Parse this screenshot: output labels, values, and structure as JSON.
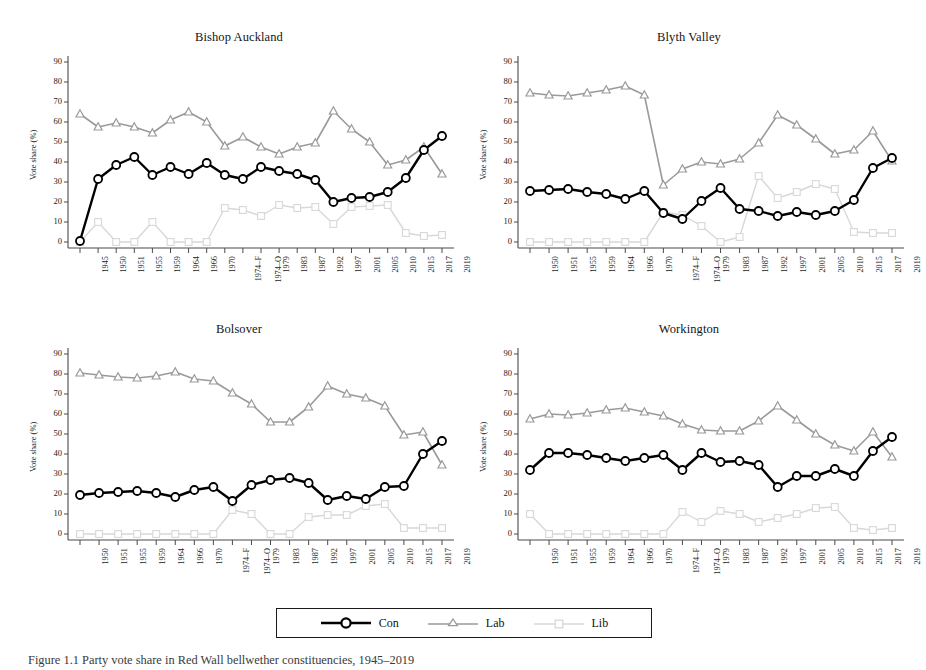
{
  "figure": {
    "caption": "Figure 1.1  Party vote share in Red Wall bellwether constituencies, 1945–2019",
    "ylabel": "Vote share (%)",
    "yticks": [
      0,
      10,
      20,
      30,
      40,
      50,
      60,
      70,
      80,
      90
    ],
    "ylim": [
      -3,
      95
    ]
  },
  "legend": {
    "position": "bottom-center",
    "items": [
      {
        "label": "Con",
        "color": "#000000",
        "marker": "circle"
      },
      {
        "label": "Lab",
        "color": "#9a9a9a",
        "marker": "triangle"
      },
      {
        "label": "Lib",
        "color": "#d5d5d5",
        "marker": "square"
      }
    ]
  },
  "colors": {
    "con": "#000000",
    "lab": "#9a9a9a",
    "lib": "#d8d8d8",
    "axis": "#4a4a4a"
  },
  "chart_data": [
    {
      "type": "line",
      "title": "Bishop Auckland",
      "xlabel": "",
      "ylabel": "Vote share (%)",
      "ylim": [
        -3,
        95
      ],
      "grid": false,
      "legend": "bottom",
      "categories": [
        "1945",
        "1950",
        "1951",
        "1955",
        "1959",
        "1964",
        "1966",
        "1970",
        "1974–F",
        "1974–O",
        "1979",
        "1983",
        "1987",
        "1992",
        "1997",
        "2001",
        "2005",
        "2010",
        "2015",
        "2017",
        "2019"
      ],
      "series": [
        {
          "name": "Con",
          "values": [
            0.5,
            31.5,
            38.5,
            42.5,
            33.5,
            37.5,
            34.0,
            39.5,
            33.5,
            31.5,
            37.5,
            35.5,
            34.0,
            31.0,
            20.0,
            22.0,
            22.5,
            25.0,
            32.0,
            46.0,
            53.0
          ]
        },
        {
          "name": "Lab",
          "values": [
            64.0,
            57.5,
            59.5,
            57.5,
            54.5,
            61.0,
            65.0,
            60.0,
            48.0,
            52.5,
            47.5,
            44.0,
            47.5,
            49.5,
            65.5,
            56.5,
            50.0,
            38.5,
            41.0,
            47.5,
            34.0
          ]
        },
        {
          "name": "Lib",
          "values": [
            0.0,
            10.0,
            0.0,
            0.0,
            10.0,
            0.0,
            0.0,
            0.0,
            17.0,
            16.0,
            13.0,
            18.5,
            17.0,
            17.5,
            9.0,
            17.5,
            18.0,
            18.5,
            4.5,
            3.0,
            3.5
          ]
        }
      ]
    },
    {
      "type": "line",
      "title": "Blyth Valley",
      "xlabel": "",
      "ylabel": "Vote share (%)",
      "ylim": [
        -3,
        95
      ],
      "grid": false,
      "legend": "bottom",
      "categories": [
        "1950",
        "1951",
        "1955",
        "1959",
        "1964",
        "1966",
        "1970",
        "1974–F",
        "1974–O",
        "1979",
        "1983",
        "1987",
        "1992",
        "1997",
        "2001",
        "2005",
        "2010",
        "2015",
        "2017",
        "2019"
      ],
      "series": [
        {
          "name": "Con",
          "values": [
            25.5,
            26.0,
            26.5,
            25.0,
            24.0,
            21.5,
            25.5,
            14.5,
            11.5,
            20.5,
            27.0,
            16.5,
            15.5,
            13.0,
            15.0,
            13.5,
            15.5,
            21.0,
            37.0,
            42.0
          ]
        },
        {
          "name": "Lab",
          "values": [
            74.5,
            73.5,
            73.0,
            74.5,
            76.0,
            78.0,
            73.5,
            28.5,
            36.5,
            40.0,
            39.0,
            41.5,
            49.5,
            63.5,
            58.5,
            51.5,
            44.0,
            46.0,
            55.5,
            40.5
          ]
        },
        {
          "name": "Lib",
          "values": [
            0.0,
            0.0,
            0.0,
            0.0,
            0.0,
            0.0,
            0.0,
            15.0,
            13.5,
            8.0,
            0.0,
            2.5,
            33.0,
            22.0,
            25.0,
            29.0,
            26.5,
            5.0,
            4.5,
            4.5
          ]
        }
      ]
    },
    {
      "type": "line",
      "title": "Bolsover",
      "xlabel": "",
      "ylabel": "Vote share (%)",
      "ylim": [
        -3,
        95
      ],
      "grid": false,
      "legend": "bottom",
      "categories": [
        "1950",
        "1951",
        "1955",
        "1959",
        "1964",
        "1966",
        "1970",
        "1974–F",
        "1974–O",
        "1979",
        "1983",
        "1987",
        "1992",
        "1997",
        "2001",
        "2005",
        "2010",
        "2015",
        "2017",
        "2019"
      ],
      "series": [
        {
          "name": "Con",
          "values": [
            19.5,
            20.5,
            21.0,
            21.5,
            20.5,
            18.5,
            22.0,
            23.5,
            16.5,
            24.5,
            27.0,
            28.0,
            25.5,
            17.0,
            19.0,
            17.5,
            23.5,
            24.0,
            40.0,
            46.5
          ]
        },
        {
          "name": "Lab",
          "values": [
            80.5,
            79.5,
            78.5,
            78.0,
            79.0,
            81.0,
            77.5,
            76.5,
            70.5,
            65.0,
            56.0,
            56.0,
            63.5,
            74.0,
            70.0,
            68.0,
            64.0,
            49.5,
            51.0,
            34.5
          ]
        },
        {
          "name": "Lib",
          "values": [
            0.0,
            0.0,
            0.0,
            0.0,
            0.0,
            0.0,
            0.0,
            0.0,
            12.0,
            10.0,
            0.0,
            0.0,
            8.5,
            9.5,
            9.5,
            14.0,
            15.0,
            3.0,
            3.0,
            3.0
          ]
        }
      ]
    },
    {
      "type": "line",
      "title": "Workington",
      "xlabel": "",
      "ylabel": "Vote share (%)",
      "ylim": [
        -3,
        95
      ],
      "grid": false,
      "legend": "bottom",
      "categories": [
        "1950",
        "1951",
        "1955",
        "1959",
        "1964",
        "1966",
        "1970",
        "1974–F",
        "1974–O",
        "1979",
        "1983",
        "1987",
        "1992",
        "1997",
        "2001",
        "2005",
        "2010",
        "2015",
        "2017",
        "2019"
      ],
      "series": [
        {
          "name": "Con",
          "values": [
            32.0,
            40.5,
            40.5,
            39.5,
            38.0,
            36.5,
            38.0,
            39.5,
            32.0,
            40.5,
            36.0,
            36.5,
            34.5,
            23.5,
            29.0,
            29.0,
            32.5,
            29.0,
            41.5,
            48.5
          ]
        },
        {
          "name": "Lab",
          "values": [
            57.5,
            60.0,
            59.5,
            60.5,
            62.0,
            63.0,
            61.0,
            59.0,
            55.0,
            52.0,
            51.5,
            51.5,
            56.5,
            64.0,
            57.0,
            50.0,
            44.5,
            41.5,
            51.0,
            38.5
          ]
        },
        {
          "name": "Lib",
          "values": [
            10.0,
            0.0,
            0.0,
            0.0,
            0.0,
            0.0,
            0.0,
            0.0,
            11.0,
            6.0,
            11.5,
            10.0,
            6.0,
            8.0,
            10.0,
            13.0,
            13.5,
            3.0,
            2.0,
            3.0
          ]
        }
      ]
    }
  ]
}
